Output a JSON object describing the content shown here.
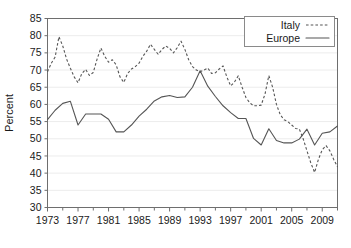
{
  "chart_data": {
    "type": "line",
    "title": "",
    "xlabel": "",
    "ylabel": "Percent",
    "xlim": [
      1973,
      2011
    ],
    "ylim": [
      30,
      85
    ],
    "grid": true,
    "legend_position": "top-right",
    "xticks": [
      1973,
      1977,
      1981,
      1985,
      1989,
      1993,
      1997,
      2001,
      2005,
      2009
    ],
    "xtick_labels": [
      "1973",
      "1977",
      "1981",
      "1985",
      "1989",
      "1993",
      "1997",
      "2001",
      "2005",
      "2009"
    ],
    "xminor_ticks": [
      1975,
      1979,
      1983,
      1987,
      1991,
      1995,
      1999,
      2003,
      2007,
      2011
    ],
    "yticks": [
      30,
      35,
      40,
      45,
      50,
      55,
      60,
      65,
      70,
      75,
      80,
      85
    ],
    "ytick_labels": [
      "30",
      "35",
      "40",
      "45",
      "50",
      "55",
      "60",
      "65",
      "70",
      "75",
      "80",
      "85"
    ],
    "x": [
      1973,
      1974,
      1975,
      1976,
      1977,
      1978,
      1979,
      1980,
      1981,
      1982,
      1983,
      1984,
      1985,
      1986,
      1987,
      1988,
      1989,
      1990,
      1991,
      1992,
      1993,
      1994,
      1995,
      1996,
      1997,
      1998,
      1999,
      2000,
      2001,
      2002,
      2003,
      2004,
      2005,
      2006,
      2007,
      2008,
      2009,
      2010,
      2011
    ],
    "series": [
      {
        "name": "Italy",
        "style": "dashed",
        "color": "#555555",
        "values": [
          70.5,
          73.5,
          79.7,
          73.0,
          68.5,
          66.3,
          70.2,
          68.5,
          69.4,
          72.5,
          76.4,
          73.3,
          72.4,
          73.5,
          71.7,
          66.4,
          69.8,
          73.5,
          76.0,
          77.5,
          75.5,
          76.9,
          76.2,
          74.3,
          78.4,
          75.0,
          71.0,
          69.0,
          69.3,
          70.9,
          71.2,
          68.0,
          65.4,
          68.3,
          63.5,
          60.5,
          59.5,
          59.7,
          68.4
        ]
      },
      {
        "name": "Europe",
        "style": "solid",
        "color": "#555555",
        "values": [
          55.6,
          58.3,
          60.3,
          60.9,
          54.0,
          57.2,
          57.2,
          57.2,
          55.7,
          52.0,
          52.0,
          54.0,
          56.6,
          58.6,
          61.0,
          62.2,
          62.6,
          62.0,
          62.2,
          65.0,
          69.8,
          65.3,
          62.3,
          59.6,
          57.6,
          55.9,
          55.9,
          50.1,
          48.2,
          52.9,
          49.5,
          48.8,
          48.8,
          49.9,
          52.8,
          48.2,
          51.6,
          52.0,
          53.7
        ]
      }
    ],
    "series_extension_note": {
      "Italy_tail_x": [
        2002,
        2003,
        2004,
        2005,
        2006,
        2007,
        2008,
        2009,
        2010,
        2011
      ],
      "Italy_tail_values": [
        68.4,
        62.0,
        57.0,
        54.0,
        52.8,
        46.5,
        40.2,
        46.0,
        47.5,
        44.0,
        41.8
      ],
      "Europe_tail_x": [
        2003,
        2004,
        2005,
        2006,
        2007,
        2008,
        2009,
        2010,
        2011
      ],
      "Europe_tail_values": [
        48.2,
        51.6,
        52.0,
        53.7,
        57.8,
        52.8,
        52.8,
        50.5,
        47.2
      ]
    },
    "italy_points": [
      [
        1973,
        69.5
      ],
      [
        1973.5,
        72.0
      ],
      [
        1974,
        73.8
      ],
      [
        1974.5,
        79.7
      ],
      [
        1975,
        77.0
      ],
      [
        1975.5,
        73.2
      ],
      [
        1976,
        70.5
      ],
      [
        1976.5,
        68.0
      ],
      [
        1977,
        66.3
      ],
      [
        1977.5,
        69.0
      ],
      [
        1978,
        70.2
      ],
      [
        1978.5,
        68.4
      ],
      [
        1979,
        69.3
      ],
      [
        1979.5,
        73.2
      ],
      [
        1980,
        76.4
      ],
      [
        1980.5,
        74.0
      ],
      [
        1981,
        72.3
      ],
      [
        1981.5,
        73.0
      ],
      [
        1982,
        71.5
      ],
      [
        1982.5,
        68.0
      ],
      [
        1983,
        66.4
      ],
      [
        1983.5,
        69.0
      ],
      [
        1984,
        70.3
      ],
      [
        1984.5,
        71.0
      ],
      [
        1985,
        72.0
      ],
      [
        1985.5,
        74.0
      ],
      [
        1986,
        75.5
      ],
      [
        1986.5,
        77.5
      ],
      [
        1987,
        76.0
      ],
      [
        1987.5,
        74.6
      ],
      [
        1988,
        76.0
      ],
      [
        1988.5,
        77.0
      ],
      [
        1989,
        76.3
      ],
      [
        1989.5,
        75.0
      ],
      [
        1990,
        76.5
      ],
      [
        1990.5,
        78.4
      ],
      [
        1991,
        76.0
      ],
      [
        1991.5,
        73.0
      ],
      [
        1992,
        71.0
      ],
      [
        1992.5,
        70.0
      ],
      [
        1993,
        69.5
      ],
      [
        1993.5,
        70.0
      ],
      [
        1994,
        70.6
      ],
      [
        1994.5,
        69.0
      ],
      [
        1995,
        69.2
      ],
      [
        1995.5,
        70.3
      ],
      [
        1996,
        71.2
      ],
      [
        1996.5,
        68.0
      ],
      [
        1997,
        65.4
      ],
      [
        1997.5,
        66.5
      ],
      [
        1998,
        68.3
      ],
      [
        1998.5,
        65.0
      ],
      [
        1999,
        62.0
      ],
      [
        1999.5,
        60.5
      ],
      [
        2000,
        59.6
      ],
      [
        2000.5,
        59.6
      ],
      [
        2001,
        59.8
      ],
      [
        2001.5,
        63.0
      ],
      [
        2002,
        68.4
      ],
      [
        2002.5,
        65.0
      ],
      [
        2003,
        60.0
      ],
      [
        2003.5,
        57.0
      ],
      [
        2004,
        55.5
      ],
      [
        2004.5,
        55.0
      ],
      [
        2005,
        54.0
      ],
      [
        2005.5,
        53.0
      ],
      [
        2006,
        52.8
      ],
      [
        2006.5,
        50.0
      ],
      [
        2007,
        46.5
      ],
      [
        2007.5,
        43.0
      ],
      [
        2008,
        40.2
      ],
      [
        2008.5,
        44.0
      ],
      [
        2009,
        46.8
      ],
      [
        2009.5,
        48.0
      ],
      [
        2010,
        46.5
      ],
      [
        2010.5,
        44.0
      ],
      [
        2011,
        41.8
      ]
    ],
    "europe_points": [
      [
        1973,
        55.6
      ],
      [
        1974,
        58.3
      ],
      [
        1975,
        60.3
      ],
      [
        1976,
        60.9
      ],
      [
        1977,
        54.0
      ],
      [
        1978,
        57.2
      ],
      [
        1979,
        57.2
      ],
      [
        1980,
        57.2
      ],
      [
        1981,
        55.7
      ],
      [
        1982,
        52.0
      ],
      [
        1983,
        52.0
      ],
      [
        1984,
        54.0
      ],
      [
        1985,
        56.6
      ],
      [
        1986,
        58.6
      ],
      [
        1987,
        61.0
      ],
      [
        1988,
        62.2
      ],
      [
        1989,
        62.6
      ],
      [
        1990,
        62.0
      ],
      [
        1991,
        62.2
      ],
      [
        1992,
        65.0
      ],
      [
        1993,
        69.8
      ],
      [
        1994,
        65.3
      ],
      [
        1995,
        62.3
      ],
      [
        1996,
        59.6
      ],
      [
        1997,
        57.6
      ],
      [
        1998,
        55.9
      ],
      [
        1999,
        55.9
      ],
      [
        2000,
        50.1
      ],
      [
        2001,
        48.2
      ],
      [
        2002,
        52.9
      ],
      [
        2003,
        49.5
      ],
      [
        2004,
        48.8
      ],
      [
        2005,
        48.8
      ],
      [
        2006,
        49.9
      ],
      [
        2007,
        52.8
      ],
      [
        2008,
        48.2
      ],
      [
        2009,
        51.6
      ],
      [
        2010,
        52.0
      ],
      [
        2011,
        53.7
      ]
    ],
    "legend": [
      {
        "label": "Italy",
        "style": "dashed"
      },
      {
        "label": "Europe",
        "style": "solid"
      }
    ]
  }
}
